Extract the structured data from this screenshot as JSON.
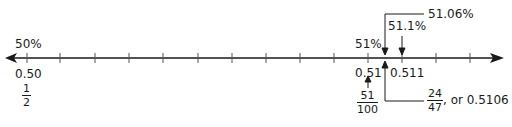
{
  "number_line": {
    "left_end": {
      "percent": "50%",
      "decimal": "0.50",
      "fraction": {
        "numerator": "1",
        "denominator": "2"
      }
    },
    "right_region": {
      "tick_051": {
        "percent": "51%",
        "decimal": "0.51",
        "fraction": {
          "numerator": "51",
          "denominator": "100"
        }
      },
      "tick_0511": {
        "percent": "51.1%",
        "decimal": "0.511"
      },
      "callout_top": "51.06%",
      "callout_bottom": {
        "fraction": {
          "numerator": "24",
          "denominator": "47"
        },
        "suffix": ", or 0.5106"
      }
    },
    "tick_count": 14
  }
}
